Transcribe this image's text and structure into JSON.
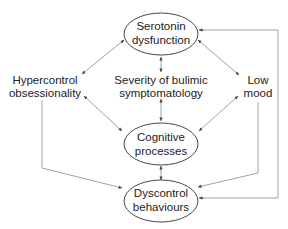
{
  "diagram": {
    "type": "causal-model",
    "nodes": {
      "serotonin": {
        "line1": "Serotonin",
        "line2": "dysfunction",
        "shape": "ellipse"
      },
      "hypercontrol": {
        "line1": "Hypercontrol",
        "line2": "obsessionality",
        "shape": "text"
      },
      "severity": {
        "line1": "Severity of bulimic",
        "line2": "symptomatology",
        "shape": "text"
      },
      "low_mood": {
        "line1": "Low",
        "line2": "mood",
        "shape": "text"
      },
      "cognitive": {
        "line1": "Cognitive",
        "line2": "processes",
        "shape": "ellipse"
      },
      "dyscontrol": {
        "line1": "Dyscontrol",
        "line2": "behaviours",
        "shape": "ellipse"
      }
    },
    "edges": [
      {
        "from": "serotonin",
        "to": "hypercontrol",
        "direction": "both"
      },
      {
        "from": "serotonin",
        "to": "severity",
        "direction": "both"
      },
      {
        "from": "serotonin",
        "to": "low_mood",
        "direction": "both"
      },
      {
        "from": "hypercontrol",
        "to": "cognitive",
        "direction": "both"
      },
      {
        "from": "severity",
        "to": "cognitive",
        "direction": "both"
      },
      {
        "from": "low_mood",
        "to": "cognitive",
        "direction": "both"
      },
      {
        "from": "cognitive",
        "to": "dyscontrol",
        "direction": "both"
      },
      {
        "from": "hypercontrol",
        "to": "dyscontrol",
        "direction": "forward"
      },
      {
        "from": "low_mood",
        "to": "dyscontrol",
        "direction": "forward"
      },
      {
        "from": "dyscontrol",
        "to": "serotonin",
        "direction": "forward"
      },
      {
        "from": "serotonin",
        "to": "dyscontrol",
        "direction": "forward"
      }
    ],
    "colors": {
      "edge": "#8a8a8a",
      "ellipse_stroke": "#333333",
      "text": "#222222"
    }
  }
}
